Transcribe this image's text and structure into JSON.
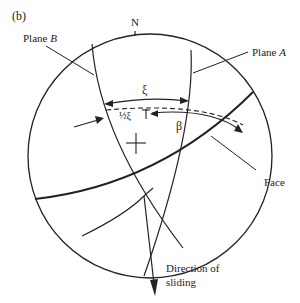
{
  "figure": {
    "panel_label": "(b)",
    "north_label": "N",
    "labels": {
      "plane_b": {
        "text": "Plane ",
        "italic": "B"
      },
      "plane_a": {
        "text": "Plane ",
        "italic": "A"
      },
      "xi": "ξ",
      "half_xi": "½ξ",
      "beta": "β",
      "face": "Face",
      "direction_line1": "Direction of",
      "direction_line2": "sliding"
    },
    "colors": {
      "stroke": "#222222",
      "background": "#ffffff"
    }
  }
}
